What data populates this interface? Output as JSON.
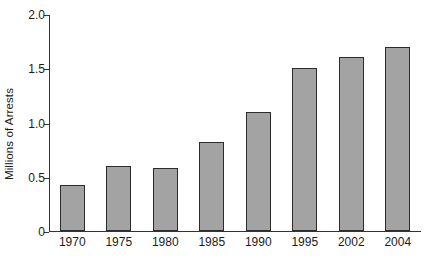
{
  "chart_data": {
    "type": "bar",
    "title": "",
    "subtitle": "",
    "xlabel": "",
    "ylabel": "Millions of Arrests",
    "categories": [
      "1970",
      "1975",
      "1980",
      "1985",
      "1990",
      "1995",
      "2002",
      "2004"
    ],
    "values": [
      0.42,
      0.6,
      0.58,
      0.82,
      1.1,
      1.5,
      1.6,
      1.7
    ],
    "ylim": [
      0,
      2.0
    ],
    "ytick_labels": [
      "2.0",
      "1.5",
      "1.0",
      "0.5",
      "0"
    ],
    "ytick_values": [
      2.0,
      1.5,
      1.0,
      0.5,
      0
    ],
    "grid": false,
    "legend": null,
    "legend_position": "none",
    "bar_fill_color": "#a3a3a3",
    "bar_edge_color": "#2b2b2b",
    "axis_color": "#333333",
    "background_color": "#ffffff",
    "annotations": []
  }
}
